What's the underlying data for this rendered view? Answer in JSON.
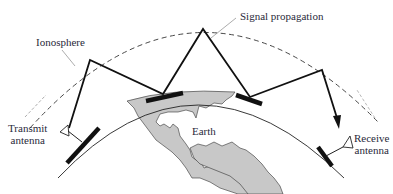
{
  "diagram": {
    "type": "ionospheric-skywave-propagation",
    "labels": {
      "ionosphere": "Ionosphere",
      "signal_propagation": "Signal propagation",
      "transmit_antenna_line1": "Transmit",
      "transmit_antenna_line2": "antenna",
      "earth": "Earth",
      "receive_antenna_line1": "Receive",
      "receive_antenna_line2": "antenna"
    },
    "colors": {
      "background": "#ffffff",
      "line": "#111111",
      "land": "#c8c8c8",
      "leader": "#888888",
      "text": "#2a2a3a"
    },
    "signal_path_hops": 3
  }
}
